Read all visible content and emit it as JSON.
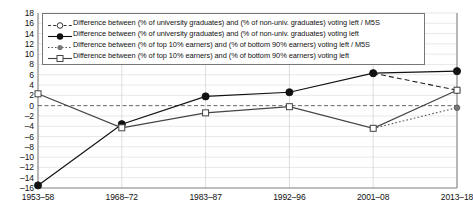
{
  "chart_data": {
    "type": "line",
    "title": "",
    "xlabel": "",
    "ylabel": "",
    "categories": [
      "1953–58",
      "1968–72",
      "1983–87",
      "1992–96",
      "2001–08",
      "2013–18"
    ],
    "ylim": [
      -16,
      18
    ],
    "yticks": [
      18,
      16,
      14,
      12,
      10,
      8,
      6,
      4,
      2,
      0,
      -2,
      -4,
      -6,
      -8,
      -10,
      -12,
      -14,
      -16
    ],
    "grid": true,
    "legend_position": "top-inside",
    "zero_line": true,
    "series": [
      {
        "name": "Difference between (% of university graduates) and (% of non-univ. graduates) voting left / M5S",
        "marker": "open-circle",
        "line": "dashed",
        "color": "#222222",
        "x": [
          "2001–08",
          "2013–18"
        ],
        "values": [
          6.3,
          3.0
        ]
      },
      {
        "name": "Difference between (% of university graduates) and (% of non-univ. graduates) voting left",
        "marker": "filled-circle",
        "line": "solid",
        "color": "#111111",
        "x": [
          "1953–58",
          "1968–72",
          "1983–87",
          "1992–96",
          "2001–08",
          "2013–18"
        ],
        "values": [
          -15.5,
          -3.6,
          1.8,
          2.6,
          6.3,
          6.7
        ]
      },
      {
        "name": "Difference between (% of top 10% earners) and (% of bottom 90% earners) voting left / M5S",
        "marker": "gray-dot",
        "line": "dotted",
        "color": "#555555",
        "x": [
          "2001–08",
          "2013–18"
        ],
        "values": [
          -4.4,
          -0.4
        ]
      },
      {
        "name": "Difference between (% of top 10% earners) and (% of bottom 90% earners) voting left",
        "marker": "open-square",
        "line": "solid",
        "color": "#444444",
        "x": [
          "1953–58",
          "1968–72",
          "1983–87",
          "1992–96",
          "2001–08",
          "2013–18"
        ],
        "values": [
          2.3,
          -4.3,
          -1.4,
          -0.2,
          -4.4,
          3.0
        ]
      }
    ]
  },
  "legend": {
    "items": [
      {
        "label": "Difference between (% of university graduates) and (% of non-univ. graduates) voting left / M5S",
        "marker": "open-circle-dashed-icon"
      },
      {
        "label": "Difference between (% of university graduates) and (% of non-univ. graduates) voting left",
        "marker": "filled-circle-solid-icon"
      },
      {
        "label": "Difference between (% of top 10% earners) and (% of bottom 90% earners) voting left / M5S",
        "marker": "gray-dot-dotted-icon"
      },
      {
        "label": "Difference between (% of top 10% earners) and (% of bottom 90% earners) voting left",
        "marker": "open-square-solid-icon"
      }
    ]
  },
  "colors": {
    "axis": "#8a8a8a",
    "grid": "#d8d8d8",
    "text": "#111111",
    "series_dark": "#111111",
    "series_gray": "#555555"
  }
}
